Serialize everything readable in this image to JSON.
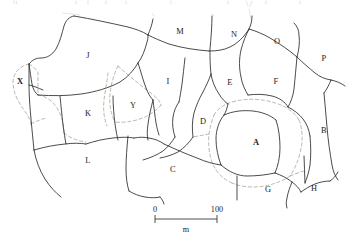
{
  "figure": {
    "type": "parcel-map"
  },
  "map": {
    "parcels": [
      {
        "id": "J",
        "label": "J",
        "x": 88,
        "y": 56,
        "emphasis": "normal"
      },
      {
        "id": "M",
        "label": "M",
        "x": 180,
        "y": 32,
        "emphasis": "normal"
      },
      {
        "id": "N",
        "label": "N",
        "x": 234,
        "y": 35,
        "emphasis": "normal"
      },
      {
        "id": "O",
        "label": "O",
        "x": 277,
        "y": 42,
        "emphasis": "normal"
      },
      {
        "id": "P",
        "label": "P",
        "x": 324,
        "y": 59,
        "emphasis": "normal"
      },
      {
        "id": "X",
        "label": "X",
        "x": 20,
        "y": 82,
        "emphasis": "bold"
      },
      {
        "id": "I",
        "label": "I",
        "x": 168,
        "y": 82,
        "emphasis": "normal"
      },
      {
        "id": "E",
        "label": "E",
        "x": 230,
        "y": 83,
        "emphasis": "normal"
      },
      {
        "id": "F",
        "label": "F",
        "x": 276,
        "y": 82,
        "emphasis": "normal"
      },
      {
        "id": "K",
        "label": "K",
        "x": 88,
        "y": 114,
        "emphasis": "normal"
      },
      {
        "id": "Y",
        "label": "Y",
        "x": 133,
        "y": 106,
        "emphasis": "normal"
      },
      {
        "id": "D",
        "label": "D",
        "x": 203,
        "y": 122,
        "emphasis": "normal"
      },
      {
        "id": "A",
        "label": "A",
        "x": 256,
        "y": 143,
        "emphasis": "bold"
      },
      {
        "id": "B",
        "label": "B",
        "x": 324,
        "y": 131,
        "emphasis": "normal"
      },
      {
        "id": "L",
        "label": "L",
        "x": 88,
        "y": 161,
        "emphasis": "normal"
      },
      {
        "id": "C",
        "label": "C",
        "x": 173,
        "y": 170,
        "emphasis": "normal"
      },
      {
        "id": "G",
        "label": "G",
        "x": 268,
        "y": 190,
        "emphasis": "normal"
      },
      {
        "id": "H",
        "label": "H",
        "x": 314,
        "y": 189,
        "emphasis": "normal"
      }
    ],
    "overlay_note": "grey dashed lines outline highlighted plots X, Y and A"
  },
  "scalebar": {
    "left_label": "0",
    "right_label": "100",
    "unit_label": "m",
    "length_px": 62,
    "value": 100,
    "units": "m"
  },
  "colors": {
    "boundary": "#2b2b2b",
    "overlay": "#b5ada0",
    "background": "#ffffff",
    "text": "#1c1c1c"
  }
}
